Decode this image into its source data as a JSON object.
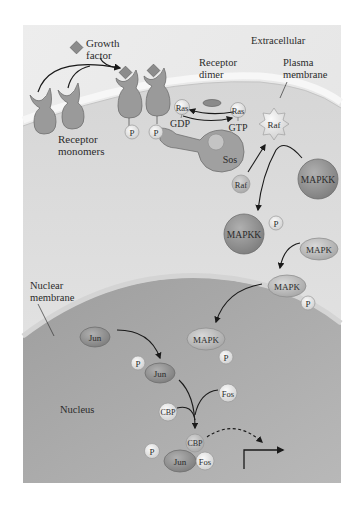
{
  "figure": {
    "colors": {
      "background": "#ffffff",
      "panel_extracellular": "#e9e9e9",
      "cytoplasm": "#d9d9d9",
      "plasma_membrane": "#f2f2f2",
      "nucleus": "#a8a8a8",
      "nuclear_membrane": "#c8c8c8",
      "receptor": "#9a9a9a",
      "growth_factor": "#8c8c8c",
      "phosphate": "#f4f4f4",
      "mapkk": "#8f8f8f",
      "mapk": "#bdbdbd",
      "jun": "#9c9c9c",
      "arrow": "#1a1a1a"
    }
  },
  "labels": {
    "growth_factor": [
      "Growth",
      "factor"
    ],
    "extracellular": "Extracellular",
    "receptor_dimer": [
      "Receptor",
      "dimer"
    ],
    "plasma_membrane": [
      "Plasma",
      "membrane"
    ],
    "receptor_monomers": [
      "Receptor",
      "monomers"
    ],
    "nuclear_membrane": [
      "Nuclear",
      "membrane"
    ],
    "nucleus": "Nucleus"
  },
  "molecules": {
    "p": "P",
    "ras": "Ras",
    "gdp": "GDP",
    "gtp": "GTP",
    "sos": "Sos",
    "raf": "Raf",
    "mapkk": "MAPKK",
    "mapk": "MAPK",
    "jun": "Jun",
    "fos": "Fos",
    "cbp": "CBP"
  }
}
